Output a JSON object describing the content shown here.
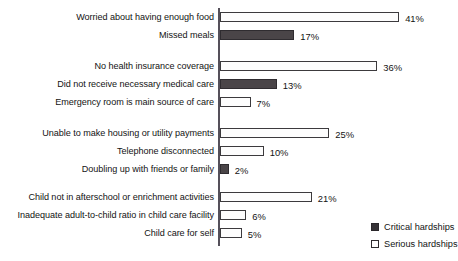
{
  "chart_data": {
    "type": "bar",
    "orientation": "horizontal",
    "title": "",
    "subtitle": "",
    "xlabel": "",
    "ylabel": "",
    "xlim": [
      0,
      45
    ],
    "grid": false,
    "value_suffix": "%",
    "legend_position": "bottom-right",
    "legend": [
      {
        "name": "Critical hardships",
        "swatch": "critical",
        "color": "#353236"
      },
      {
        "name": "Serious hardships",
        "swatch": "serious",
        "color": "#ffffff"
      }
    ],
    "series": [
      {
        "name": "Critical hardships",
        "key": "critical"
      },
      {
        "name": "Serious hardships",
        "key": "serious"
      }
    ],
    "groups": [
      {
        "name": "food",
        "rows": [
          {
            "category": "Worried about having enough food",
            "value": 41,
            "label": "41%",
            "series": "serious"
          },
          {
            "category": "Missed meals",
            "value": 17,
            "label": "17%",
            "series": "critical"
          }
        ]
      },
      {
        "name": "health-care",
        "rows": [
          {
            "category": "No health insurance coverage",
            "value": 36,
            "label": "36%",
            "series": "serious"
          },
          {
            "category": "Did not receive necessary medical care",
            "value": 13,
            "label": "13%",
            "series": "critical"
          },
          {
            "category": "Emergency room is main source of care",
            "value": 7,
            "label": "7%",
            "series": "serious"
          }
        ]
      },
      {
        "name": "housing",
        "rows": [
          {
            "category": "Unable to make housing or utility payments",
            "value": 25,
            "label": "25%",
            "series": "serious"
          },
          {
            "category": "Telephone disconnected",
            "value": 10,
            "label": "10%",
            "series": "serious"
          },
          {
            "category": "Doubling up with friends or family",
            "value": 2,
            "label": "2%",
            "series": "critical"
          }
        ]
      },
      {
        "name": "child-care",
        "rows": [
          {
            "category": "Child not in afterschool or enrichment activities",
            "value": 21,
            "label": "21%",
            "series": "serious"
          },
          {
            "category": "Inadequate adult-to-child ratio in child care facility",
            "value": 6,
            "label": "6%",
            "series": "serious"
          },
          {
            "category": "Child care for self",
            "value": 5,
            "label": "5%",
            "series": "serious"
          }
        ]
      }
    ],
    "categories": [
      "Worried about having enough food",
      "Missed meals",
      "No health insurance coverage",
      "Did not receive necessary medical care",
      "Emergency room is main source of care",
      "Unable to make housing or utility payments",
      "Telephone disconnected",
      "Doubling up with friends or family",
      "Child not in afterschool or enrichment activities",
      "Inadequate adult-to-child ratio in child care facility",
      "Child care for self"
    ],
    "values": [
      41,
      17,
      36,
      13,
      7,
      25,
      10,
      2,
      21,
      6,
      5
    ]
  },
  "layout": {
    "axis_x": 218,
    "axis_top": 8,
    "axis_bottom": 246,
    "px_per_percent": 4.37,
    "row_tops": [
      11,
      29,
      60,
      78,
      96,
      127,
      145,
      163,
      191,
      209,
      227
    ]
  }
}
